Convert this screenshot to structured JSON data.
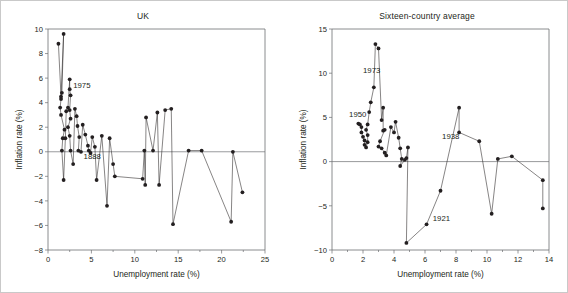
{
  "figure": {
    "background": "#ffffff",
    "border_color": "#c9c9c9",
    "ink_color": "#231f20",
    "axis_color": "#6d6e71"
  },
  "panels": [
    {
      "id": "uk",
      "title": "UK"
    },
    {
      "id": "sixteen",
      "title": "Sixteen-country average"
    }
  ],
  "chart_data": [
    {
      "type": "line",
      "title": "UK",
      "xlabel": "Unemployment rate (%)",
      "ylabel": "Inflation rate (%)",
      "xlim": [
        0,
        25
      ],
      "ylim": [
        -8,
        10
      ],
      "xticks": [
        0,
        5,
        10,
        15,
        20,
        25
      ],
      "yticks": [
        10,
        8,
        6,
        4,
        2,
        0,
        -2,
        -4,
        -6,
        -8
      ],
      "xtick_labels": [
        "0",
        "5",
        "10",
        "15",
        "20",
        "25"
      ],
      "ytick_labels": [
        "10",
        "8",
        "6",
        "4",
        "2",
        "0",
        "−2",
        "−4",
        "−6",
        "−8"
      ],
      "grid": false,
      "legend": "none",
      "zero_line": 0,
      "markers": "filled-circle",
      "series": [
        {
          "name": "UK unemployment vs inflation path",
          "points": [
            [
              1.2,
              8.8
            ],
            [
              1.5,
              4.5
            ],
            [
              1.8,
              9.6
            ],
            [
              1.6,
              4.8
            ],
            [
              1.5,
              4.3
            ],
            [
              1.4,
              3.6
            ],
            [
              1.5,
              3.0
            ],
            [
              1.9,
              1.8
            ],
            [
              1.7,
              1.1
            ],
            [
              1.6,
              0.1
            ],
            [
              1.8,
              -2.3
            ],
            [
              2.0,
              1.1
            ],
            [
              2.1,
              3.3
            ],
            [
              2.3,
              3.6
            ],
            [
              2.5,
              5.9
            ],
            [
              2.5,
              5.1
            ],
            [
              2.6,
              4.6
            ],
            [
              2.5,
              3.4
            ],
            [
              2.6,
              2.7
            ],
            [
              2.3,
              2.0
            ],
            [
              2.5,
              1.3
            ],
            [
              2.6,
              0.1
            ],
            [
              2.9,
              -1.0
            ],
            [
              3.1,
              3.5
            ],
            [
              3.3,
              2.9
            ],
            [
              3.4,
              2.1
            ],
            [
              3.6,
              1.2
            ],
            [
              3.5,
              0.1
            ],
            [
              3.8,
              0.0
            ],
            [
              4.0,
              2.2
            ],
            [
              4.3,
              1.4
            ],
            [
              4.6,
              0.5
            ],
            [
              4.7,
              0.1
            ],
            [
              4.9,
              -0.1
            ],
            [
              5.1,
              1.2
            ],
            [
              5.4,
              0.4
            ],
            [
              5.6,
              -2.3
            ],
            [
              6.2,
              1.3
            ],
            [
              6.8,
              -4.4
            ],
            [
              7.1,
              1.1
            ],
            [
              7.5,
              -1.0
            ],
            [
              7.7,
              -2.0
            ],
            [
              10.9,
              -2.2
            ],
            [
              11.1,
              0.1
            ],
            [
              11.2,
              -2.7
            ],
            [
              11.3,
              2.8
            ],
            [
              12.1,
              0.1
            ],
            [
              12.6,
              3.2
            ],
            [
              12.8,
              -2.7
            ],
            [
              13.5,
              3.4
            ],
            [
              14.2,
              3.5
            ],
            [
              14.4,
              -5.9
            ],
            [
              16.2,
              0.1
            ],
            [
              17.7,
              0.1
            ],
            [
              21.1,
              -5.7
            ],
            [
              21.3,
              0.0
            ],
            [
              22.4,
              -3.3
            ]
          ]
        }
      ],
      "annotations": [
        {
          "label": "1975",
          "x": 2.9,
          "y": 5.2
        },
        {
          "label": "1888",
          "x": 4.1,
          "y": -0.6
        }
      ]
    },
    {
      "type": "line",
      "title": "Sixteen-country average",
      "xlabel": "Unemployment rate (%)",
      "ylabel": "Inflation rate (%)",
      "xlim": [
        0,
        14
      ],
      "ylim": [
        -10,
        15
      ],
      "xticks": [
        0,
        2,
        4,
        6,
        8,
        10,
        12,
        14
      ],
      "yticks": [
        15,
        10,
        5,
        0,
        -5,
        -10
      ],
      "xtick_labels": [
        "0",
        "2",
        "4",
        "6",
        "8",
        "10",
        "12",
        "14"
      ],
      "ytick_labels": [
        "15",
        "10",
        "5",
        "0",
        "−5",
        "−10"
      ],
      "grid": false,
      "legend": "none",
      "zero_line": 0,
      "markers": "filled-circle",
      "series": [
        {
          "name": "Sixteen-country average path",
          "points": [
            [
              1.7,
              4.3
            ],
            [
              1.8,
              4.2
            ],
            [
              1.9,
              3.9
            ],
            [
              1.9,
              3.3
            ],
            [
              2.0,
              2.8
            ],
            [
              2.1,
              2.4
            ],
            [
              2.1,
              1.9
            ],
            [
              2.2,
              1.6
            ],
            [
              2.3,
              2.2
            ],
            [
              2.3,
              3.0
            ],
            [
              2.2,
              3.6
            ],
            [
              2.3,
              4.2
            ],
            [
              2.4,
              5.6
            ],
            [
              2.5,
              6.7
            ],
            [
              2.7,
              8.4
            ],
            [
              2.8,
              13.3
            ],
            [
              3.0,
              12.8
            ],
            [
              3.2,
              4.7
            ],
            [
              3.3,
              6.1
            ],
            [
              3.3,
              3.5
            ],
            [
              3.4,
              3.6
            ],
            [
              3.1,
              2.3
            ],
            [
              3.0,
              1.7
            ],
            [
              3.2,
              1.5
            ],
            [
              3.4,
              1.0
            ],
            [
              3.5,
              0.7
            ],
            [
              3.8,
              3.9
            ],
            [
              4.0,
              3.3
            ],
            [
              4.1,
              4.5
            ],
            [
              4.3,
              2.7
            ],
            [
              4.4,
              1.5
            ],
            [
              4.5,
              0.3
            ],
            [
              4.4,
              -0.5
            ],
            [
              4.7,
              0.2
            ],
            [
              4.8,
              0.4
            ],
            [
              4.9,
              1.6
            ],
            [
              4.8,
              -9.2
            ],
            [
              6.1,
              -7.1
            ],
            [
              7.0,
              -3.3
            ],
            [
              8.2,
              6.1
            ],
            [
              8.2,
              3.3
            ],
            [
              9.5,
              2.3
            ],
            [
              10.3,
              -5.9
            ],
            [
              10.7,
              0.3
            ],
            [
              11.6,
              0.6
            ],
            [
              13.6,
              -2.1
            ],
            [
              13.6,
              -5.3
            ]
          ]
        }
      ],
      "annotations": [
        {
          "label": "1973",
          "x": 2.0,
          "y": 10.0
        },
        {
          "label": "1950",
          "x": 1.1,
          "y": 5.1
        },
        {
          "label": "1938",
          "x": 7.1,
          "y": 2.6
        },
        {
          "label": "1921",
          "x": 6.5,
          "y": -6.7
        }
      ]
    }
  ]
}
